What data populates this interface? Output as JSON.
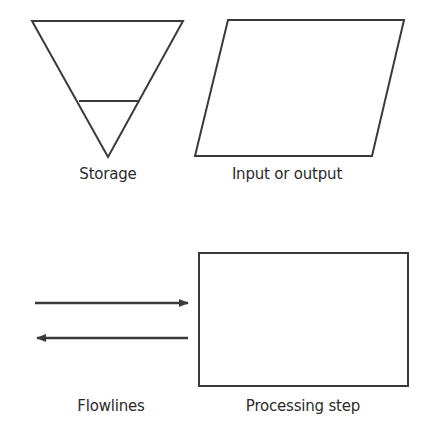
{
  "diagram": {
    "type": "flowchart-symbol-legend",
    "stroke_color": "#3a3a3a",
    "background": "#ffffff",
    "symbols": [
      {
        "id": "storage",
        "shape": "inverted-triangle-with-band",
        "label": "Storage"
      },
      {
        "id": "input-output",
        "shape": "parallelogram",
        "label": "Input or output"
      },
      {
        "id": "flowlines",
        "shape": "opposed-arrows",
        "label": "Flowlines"
      },
      {
        "id": "processing-step",
        "shape": "rectangle",
        "label": "Processing step"
      }
    ]
  }
}
